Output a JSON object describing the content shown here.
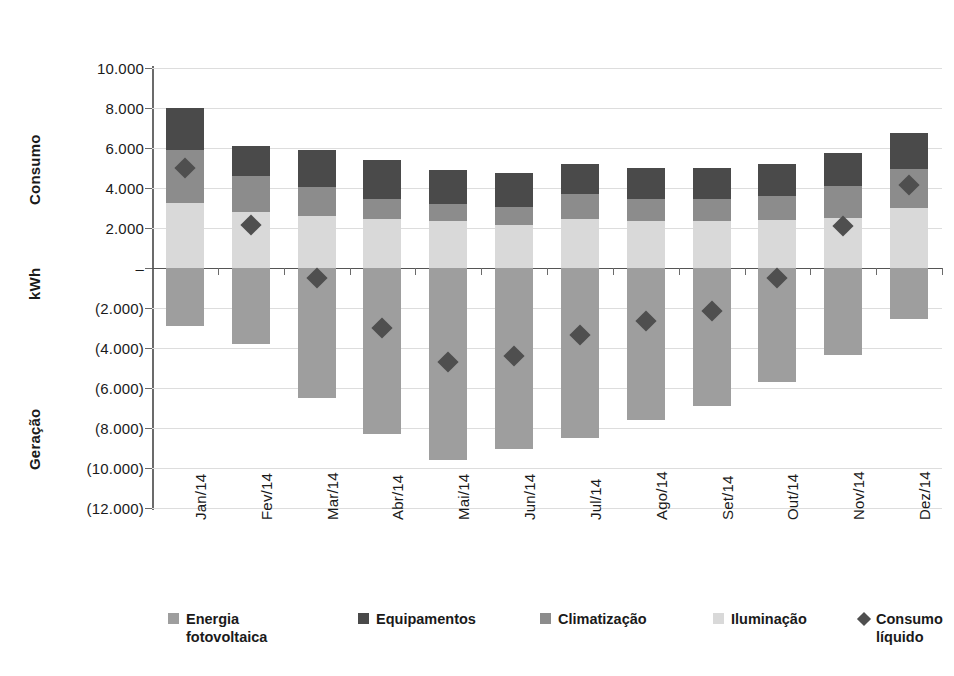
{
  "chart_data": {
    "type": "bar",
    "stacked": true,
    "title": "",
    "xlabel": "",
    "ylabel": "kWh",
    "axis_group_labels": [
      "Consumo",
      "kWh",
      "Geração"
    ],
    "ylim": [
      -12000,
      10000
    ],
    "ytick_values": [
      10000,
      8000,
      6000,
      4000,
      2000,
      0,
      -2000,
      -4000,
      -6000,
      -8000,
      -10000,
      -12000
    ],
    "ytick_labels": [
      "10.000",
      "8.000",
      "6.000",
      "4.000",
      "2.000",
      "–",
      "(2.000)",
      "(4.000)",
      "(6.000)",
      "(8.000)",
      "(10.000)",
      "(12.000)"
    ],
    "grid": true,
    "legend_position": "bottom",
    "categories": [
      "Jan/14",
      "Fev/14",
      "Mar/14",
      "Abr/14",
      "Mai/14",
      "Jun/14",
      "Jul/14",
      "Ago/14",
      "Set/14",
      "Out/14",
      "Nov/14",
      "Dez/14"
    ],
    "series": [
      {
        "name": "Iluminação",
        "color": "#d9d9d9",
        "stack": "positive",
        "values": [
          3250,
          2800,
          2600,
          2450,
          2350,
          2150,
          2450,
          2350,
          2350,
          2400,
          2500,
          3000
        ]
      },
      {
        "name": "Climatização",
        "color": "#8c8c8c",
        "stack": "positive",
        "values": [
          2650,
          1800,
          1450,
          1000,
          850,
          900,
          1250,
          1100,
          1100,
          1200,
          1600,
          1950
        ]
      },
      {
        "name": "Equipamentos",
        "color": "#4a4a4a",
        "stack": "positive",
        "values": [
          2100,
          1500,
          1850,
          1950,
          1700,
          1700,
          1500,
          1550,
          1550,
          1600,
          1650,
          1800
        ]
      },
      {
        "name": "Energia fotovoltaica",
        "color": "#9e9e9e",
        "stack": "negative",
        "values": [
          -2900,
          -3800,
          -6500,
          -8300,
          -9600,
          -9050,
          -8500,
          -7600,
          -6900,
          -5700,
          -4350,
          -2550
        ]
      }
    ],
    "marker_series": {
      "name": "Consumo líquido",
      "color": "#4f4f4f",
      "marker": "diamond",
      "values": [
        5000,
        2150,
        -500,
        -3000,
        -4700,
        -4400,
        -3350,
        -2650,
        -2150,
        -500,
        2100,
        4150
      ]
    },
    "positive_totals": [
      8000,
      6100,
      5900,
      5400,
      4900,
      4750,
      5200,
      5000,
      5000,
      5200,
      5750,
      6750
    ]
  },
  "legend": {
    "items": [
      {
        "label": "Energia fotovoltaica",
        "swatch": "legend-swatch-energia-fotovoltaica",
        "color": "#9e9e9e",
        "shape": "square"
      },
      {
        "label": "Equipamentos",
        "swatch": "legend-swatch-equipamentos",
        "color": "#4a4a4a",
        "shape": "square"
      },
      {
        "label": "Climatização",
        "swatch": "legend-swatch-climatizacao",
        "color": "#8c8c8c",
        "shape": "square"
      },
      {
        "label": "Iluminação",
        "swatch": "legend-swatch-iluminacao",
        "color": "#d9d9d9",
        "shape": "square"
      },
      {
        "label": "Consumo líquido",
        "swatch": "legend-swatch-consumo-liquido",
        "color": "#4f4f4f",
        "shape": "diamond"
      }
    ]
  },
  "axis": {
    "left_group_top": "Consumo",
    "left_group_middle": "kWh",
    "left_group_bottom": "Geração"
  }
}
